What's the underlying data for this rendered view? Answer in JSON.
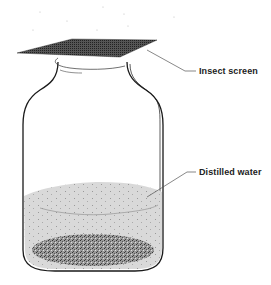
{
  "diagram": {
    "labels": {
      "insect_screen": "Insect screen",
      "distilled_water": "Distilled water"
    },
    "colors": {
      "outline": "#1a1a1a",
      "water": "#d6d6d6",
      "sediment": "#8a8a8a",
      "screen": "#3a3a3a",
      "background": "#ffffff"
    }
  }
}
